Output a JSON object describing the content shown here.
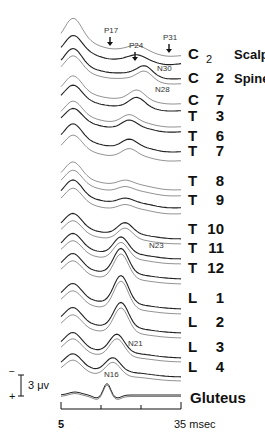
{
  "figure": {
    "type": "evoked-potential-traces",
    "x_axis": {
      "start_label": "5",
      "end_label": "35 msec",
      "range_ms": [
        5,
        35
      ],
      "ticks_ms": [
        5,
        15,
        25,
        35
      ]
    },
    "scale_bar": {
      "label": "3 μv",
      "neg_sign": "−",
      "pos_sign": "+"
    },
    "channels": [
      {
        "level": "C",
        "num": "2",
        "sub": true,
        "side": "Scalp",
        "y": 54
      },
      {
        "level": "C",
        "num": "2",
        "sub": false,
        "side": "Spine",
        "y": 78
      },
      {
        "level": "C",
        "num": "7",
        "side": "",
        "y": 100
      },
      {
        "level": "T",
        "num": "3",
        "side": "",
        "y": 116
      },
      {
        "level": "T",
        "num": "6",
        "side": "",
        "y": 136
      },
      {
        "level": "T",
        "num": "7",
        "side": "",
        "y": 151
      },
      {
        "level": "T",
        "num": "8",
        "side": "",
        "y": 181
      },
      {
        "level": "T",
        "num": "9",
        "side": "",
        "y": 200
      },
      {
        "level": "T",
        "num": "10",
        "side": "",
        "y": 229
      },
      {
        "level": "T",
        "num": "11",
        "side": "",
        "y": 248
      },
      {
        "level": "T",
        "num": "12",
        "side": "",
        "y": 268
      },
      {
        "level": "L",
        "num": "1",
        "side": "",
        "y": 298
      },
      {
        "level": "L",
        "num": "2",
        "side": "",
        "y": 322
      },
      {
        "level": "L",
        "num": "3",
        "side": "",
        "y": 347
      },
      {
        "level": "L",
        "num": "4",
        "side": "",
        "y": 367
      }
    ],
    "gluteus_label": "Gluteus",
    "annotations": [
      {
        "text": "P17",
        "x": 104,
        "y": 26,
        "arrow": true
      },
      {
        "text": "P24",
        "x": 129,
        "y": 41,
        "arrow": true
      },
      {
        "text": "P31",
        "x": 163,
        "y": 33,
        "arrow": true
      },
      {
        "text": "N30",
        "x": 157,
        "y": 64
      },
      {
        "text": "N28",
        "x": 155,
        "y": 85
      },
      {
        "text": "N23",
        "x": 149,
        "y": 241
      },
      {
        "text": "N21",
        "x": 128,
        "y": 339
      },
      {
        "text": "N16",
        "x": 104,
        "y": 370
      }
    ]
  }
}
